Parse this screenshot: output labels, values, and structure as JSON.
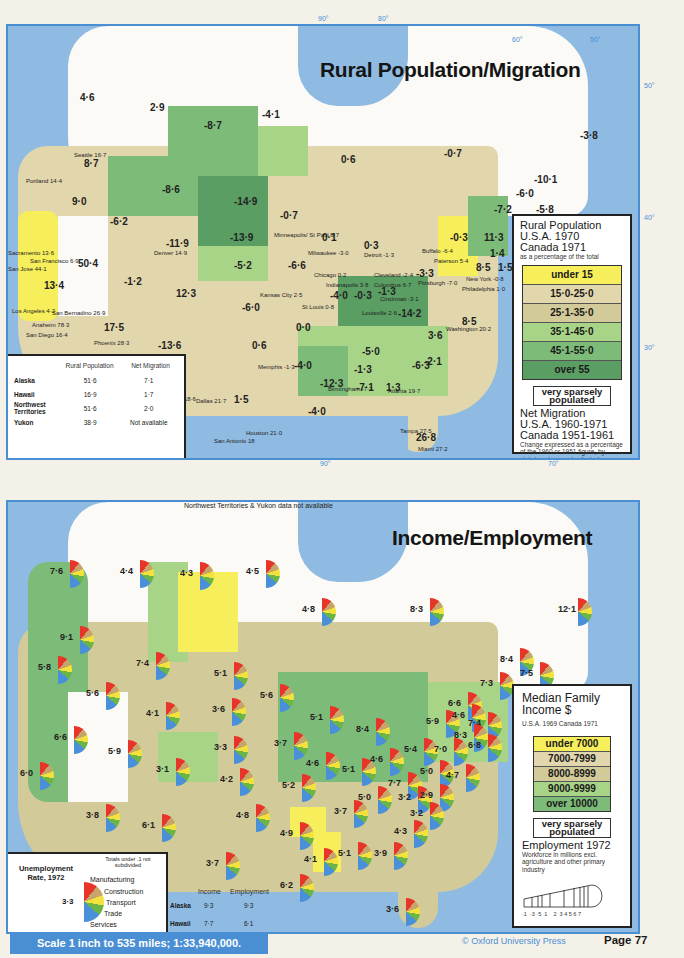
{
  "page": {
    "scale_text": "Scale 1 inch to 535 miles; 1:33,940,000.",
    "copyright": "© Oxford University Press",
    "page_label": "Page 77"
  },
  "colors": {
    "sea": "#8fbbe3",
    "border_blue": "#4a8fd4",
    "cls_under15": "#f6ee5a",
    "cls_15_25": "#e2d6ac",
    "cls_25_35": "#d2ca98",
    "cls_35_45": "#a8d488",
    "cls_45_55": "#7dbb78",
    "cls_over55": "#5a9e63",
    "pie_manufacturing": "#e8352a",
    "pie_construction": "#c7a46a",
    "pie_transport": "#f3e23c",
    "pie_trade": "#6ab545",
    "pie_services": "#4a90d9"
  },
  "map1": {
    "title": "Rural Population/Migration",
    "degrees": {
      "lon90": "90°",
      "lon80": "80°",
      "lon60": "60°",
      "lon50": "50°",
      "lat50": "50°",
      "lat40": "40°",
      "lat30": "30°",
      "bottom90": "90°",
      "bottom70": "70°"
    },
    "legend": {
      "title1": "Rural Population",
      "title2": "U.S.A. 1970",
      "title3": "Canada 1971",
      "subtitle": "as a percentage of the total",
      "classes": [
        "under 15",
        "15·0-25·0",
        "25·1-35·0",
        "35·1-45·0",
        "45·1-55·0",
        "over 55"
      ],
      "sparse": "very sparsely populated",
      "migration_title1": "Net Migration",
      "migration_title2": "U.S.A. 1960-1971",
      "migration_title3": "Canada 1951-1961",
      "migration_note": "Change expressed as a percentage of the 1960 or 1951 figure, by state/province and selected Standard Metropolitan Statistical Areas"
    },
    "table": {
      "headers": [
        "",
        "Rural Population",
        "Net Migration"
      ],
      "rows": [
        [
          "Alaska",
          "51·6",
          "7·1"
        ],
        [
          "Hawaii",
          "16·9",
          "1·7"
        ],
        [
          "Northwest Territories",
          "51·6",
          "2·0"
        ],
        [
          "Yukon",
          "38·9",
          "Not available"
        ]
      ]
    },
    "region_values": [
      {
        "v": "4·6",
        "x": 72,
        "y": 66
      },
      {
        "v": "2·9",
        "x": 142,
        "y": 76
      },
      {
        "v": "-8·7",
        "x": 196,
        "y": 94
      },
      {
        "v": "-4·1",
        "x": 254,
        "y": 83
      },
      {
        "v": "0·6",
        "x": 333,
        "y": 128
      },
      {
        "v": "-0·7",
        "x": 436,
        "y": 122
      },
      {
        "v": "-3·8",
        "x": 572,
        "y": 104
      },
      {
        "v": "8·7",
        "x": 76,
        "y": 132
      },
      {
        "v": "9·0",
        "x": 64,
        "y": 170
      },
      {
        "v": "-8·6",
        "x": 154,
        "y": 158
      },
      {
        "v": "-14·9",
        "x": 226,
        "y": 170
      },
      {
        "v": "-0·7",
        "x": 272,
        "y": 184
      },
      {
        "v": "-6·2",
        "x": 102,
        "y": 190
      },
      {
        "v": "-13·9",
        "x": 222,
        "y": 206
      },
      {
        "v": "-11·9",
        "x": 158,
        "y": 212
      },
      {
        "v": "0·1",
        "x": 314,
        "y": 206
      },
      {
        "v": "0·3",
        "x": 356,
        "y": 214
      },
      {
        "v": "-10·1",
        "x": 526,
        "y": 148
      },
      {
        "v": "-6·0",
        "x": 508,
        "y": 162
      },
      {
        "v": "-7·2",
        "x": 486,
        "y": 178
      },
      {
        "v": "-5·8",
        "x": 528,
        "y": 178
      },
      {
        "v": "-0·3",
        "x": 442,
        "y": 206
      },
      {
        "v": "11·3",
        "x": 476,
        "y": 206
      },
      {
        "v": "1·4",
        "x": 482,
        "y": 222
      },
      {
        "v": "8·5",
        "x": 468,
        "y": 236
      },
      {
        "v": "1·5",
        "x": 490,
        "y": 236
      },
      {
        "v": "50·4",
        "x": 70,
        "y": 232
      },
      {
        "v": "13·4",
        "x": 36,
        "y": 254
      },
      {
        "v": "-1·2",
        "x": 116,
        "y": 250
      },
      {
        "v": "12·3",
        "x": 168,
        "y": 262
      },
      {
        "v": "-5·2",
        "x": 226,
        "y": 234
      },
      {
        "v": "-6·6",
        "x": 280,
        "y": 234
      },
      {
        "v": "-3·3",
        "x": 408,
        "y": 242
      },
      {
        "v": "-6·0",
        "x": 234,
        "y": 276
      },
      {
        "v": "-4·0",
        "x": 322,
        "y": 264
      },
      {
        "v": "-0·3",
        "x": 346,
        "y": 264
      },
      {
        "v": "-1·3",
        "x": 370,
        "y": 260
      },
      {
        "v": "-14·2",
        "x": 390,
        "y": 282
      },
      {
        "v": "8·5",
        "x": 454,
        "y": 290
      },
      {
        "v": "17·5",
        "x": 96,
        "y": 296
      },
      {
        "v": "-13·6",
        "x": 150,
        "y": 314
      },
      {
        "v": "0·0",
        "x": 288,
        "y": 296
      },
      {
        "v": "-5·0",
        "x": 354,
        "y": 320
      },
      {
        "v": "3·6",
        "x": 420,
        "y": 304
      },
      {
        "v": "0·6",
        "x": 244,
        "y": 314
      },
      {
        "v": "-1·3",
        "x": 346,
        "y": 338
      },
      {
        "v": "-2·1",
        "x": 416,
        "y": 330
      },
      {
        "v": "-4·0",
        "x": 286,
        "y": 334
      },
      {
        "v": "-6·3",
        "x": 404,
        "y": 334
      },
      {
        "v": "-12·3",
        "x": 312,
        "y": 352
      },
      {
        "v": "-7·1",
        "x": 348,
        "y": 356
      },
      {
        "v": "1·3",
        "x": 378,
        "y": 356
      },
      {
        "v": "1·5",
        "x": 226,
        "y": 368
      },
      {
        "v": "-4·0",
        "x": 300,
        "y": 380
      },
      {
        "v": "26·8",
        "x": 408,
        "y": 406
      }
    ],
    "cities": [
      {
        "t": "Seattle 16·7",
        "x": 66,
        "y": 126
      },
      {
        "t": "Portland 14·4",
        "x": 18,
        "y": 152
      },
      {
        "t": "Sacramento 13·6",
        "x": 0,
        "y": 224
      },
      {
        "t": "San Francisco 6·9",
        "x": 22,
        "y": 232
      },
      {
        "t": "San Jose 44·1",
        "x": 0,
        "y": 240
      },
      {
        "t": "Los Angeles 4·2",
        "x": 4,
        "y": 282
      },
      {
        "t": "San Bernadino 26·9",
        "x": 44,
        "y": 284
      },
      {
        "t": "Anaheim 78·3",
        "x": 24,
        "y": 296
      },
      {
        "t": "San Diego 16·4",
        "x": 18,
        "y": 306
      },
      {
        "t": "Phoenix 28·3",
        "x": 86,
        "y": 314
      },
      {
        "t": "Denver 14·9",
        "x": 146,
        "y": 224
      },
      {
        "t": "Minneapolis/ St Paul 6·7",
        "x": 266,
        "y": 206
      },
      {
        "t": "Milwaukee -3·0",
        "x": 300,
        "y": 224
      },
      {
        "t": "Detroit -1·3",
        "x": 356,
        "y": 226
      },
      {
        "t": "Chicago 0·2",
        "x": 306,
        "y": 246
      },
      {
        "t": "Indianapolis 3·8",
        "x": 318,
        "y": 256
      },
      {
        "t": "Kansas City 2·5",
        "x": 252,
        "y": 266
      },
      {
        "t": "St Louis 0·8",
        "x": 294,
        "y": 278
      },
      {
        "t": "Cleveland -2·4",
        "x": 366,
        "y": 246
      },
      {
        "t": "Columbus 6·7",
        "x": 366,
        "y": 256
      },
      {
        "t": "Cincinnati -3·1",
        "x": 372,
        "y": 270
      },
      {
        "t": "Louisville 2·6",
        "x": 354,
        "y": 284
      },
      {
        "t": "Buffalo -6·4",
        "x": 414,
        "y": 222
      },
      {
        "t": "Paterson 5·4",
        "x": 426,
        "y": 232
      },
      {
        "t": "Pittsburgh -7·0",
        "x": 410,
        "y": 254
      },
      {
        "t": "New York -0·8",
        "x": 458,
        "y": 250
      },
      {
        "t": "Philadelphia 1·0",
        "x": 454,
        "y": 260
      },
      {
        "t": "Washington 20·2",
        "x": 438,
        "y": 300
      },
      {
        "t": "Memphis -1·3",
        "x": 250,
        "y": 338
      },
      {
        "t": "Birmingham -7·3",
        "x": 320,
        "y": 360
      },
      {
        "t": "Atlanta 19·7",
        "x": 380,
        "y": 362
      },
      {
        "t": "Fort Worth 18·6",
        "x": 146,
        "y": 370
      },
      {
        "t": "Dallas 21·7",
        "x": 188,
        "y": 372
      },
      {
        "t": "Houston 21·0",
        "x": 238,
        "y": 404
      },
      {
        "t": "San Antonio 18",
        "x": 206,
        "y": 412
      },
      {
        "t": "Tampa 27·5",
        "x": 392,
        "y": 402
      },
      {
        "t": "Miami 27·2",
        "x": 410,
        "y": 420
      }
    ]
  },
  "map2": {
    "title": "Income/Employment",
    "note": "Northwest Territories & Yukon data not available",
    "legend": {
      "title1": "Median Family",
      "title2": "Income $",
      "subtitle": "U.S.A. 1969   Canada 1971",
      "classes": [
        "under 7000",
        "7000-7999",
        "8000-8999",
        "9000-9999",
        "over 10000"
      ],
      "sparse": "very sparsely populated",
      "employment_title": "Employment 1972",
      "employment_note": "Workforce in millions excl. agriculture and other primary industry",
      "scale_ticks": "·1  ·3 ·5  1    2  3 4 5 6 7"
    },
    "unemployment_key": {
      "title": "Unemployment Rate, 1972",
      "note": "Totals under .1 not subdivided",
      "sample_value": "3·3",
      "sectors": [
        "Manufacturing",
        "Construction",
        "Transport",
        "Trade",
        "Services"
      ]
    },
    "inset": {
      "headers": [
        "",
        "Income",
        "Employment"
      ],
      "rows": [
        [
          "Alaska",
          "9·3",
          "9·3"
        ],
        [
          "Hawaii",
          "7·7",
          "6·1"
        ]
      ]
    },
    "pies": [
      {
        "v": "7·6",
        "x": 60,
        "y": 58
      },
      {
        "v": "4·4",
        "x": 130,
        "y": 58
      },
      {
        "v": "4·3",
        "x": 190,
        "y": 60
      },
      {
        "v": "4·5",
        "x": 256,
        "y": 58
      },
      {
        "v": "4·8",
        "x": 312,
        "y": 96
      },
      {
        "v": "8·3",
        "x": 420,
        "y": 96
      },
      {
        "v": "12·1",
        "x": 568,
        "y": 96
      },
      {
        "v": "9·1",
        "x": 70,
        "y": 124
      },
      {
        "v": "5·8",
        "x": 48,
        "y": 154
      },
      {
        "v": "7·4",
        "x": 146,
        "y": 150
      },
      {
        "v": "5·1",
        "x": 224,
        "y": 160
      },
      {
        "v": "8·4",
        "x": 510,
        "y": 146
      },
      {
        "v": "7·5",
        "x": 530,
        "y": 160
      },
      {
        "v": "7·3",
        "x": 490,
        "y": 170
      },
      {
        "v": "5·6",
        "x": 96,
        "y": 180
      },
      {
        "v": "5·6",
        "x": 270,
        "y": 182
      },
      {
        "v": "6·6",
        "x": 458,
        "y": 190
      },
      {
        "v": "4·1",
        "x": 156,
        "y": 200
      },
      {
        "v": "3·6",
        "x": 222,
        "y": 196
      },
      {
        "v": "5·1",
        "x": 320,
        "y": 204
      },
      {
        "v": "8·4",
        "x": 366,
        "y": 216
      },
      {
        "v": "5·9",
        "x": 436,
        "y": 208
      },
      {
        "v": "4·6",
        "x": 462,
        "y": 202
      },
      {
        "v": "7·4",
        "x": 478,
        "y": 210
      },
      {
        "v": "8·3",
        "x": 464,
        "y": 222
      },
      {
        "v": "6·8",
        "x": 478,
        "y": 232
      },
      {
        "v": "6·6",
        "x": 64,
        "y": 224
      },
      {
        "v": "3·3",
        "x": 224,
        "y": 234
      },
      {
        "v": "3·7",
        "x": 284,
        "y": 230
      },
      {
        "v": "5·4",
        "x": 414,
        "y": 236
      },
      {
        "v": "7·0",
        "x": 444,
        "y": 236
      },
      {
        "v": "5·9",
        "x": 118,
        "y": 238
      },
      {
        "v": "4·6",
        "x": 316,
        "y": 250
      },
      {
        "v": "5·1",
        "x": 352,
        "y": 256
      },
      {
        "v": "4·6",
        "x": 380,
        "y": 246
      },
      {
        "v": "5·0",
        "x": 430,
        "y": 258
      },
      {
        "v": "4·7",
        "x": 456,
        "y": 262
      },
      {
        "v": "6·0",
        "x": 30,
        "y": 260
      },
      {
        "v": "3·1",
        "x": 166,
        "y": 256
      },
      {
        "v": "4·2",
        "x": 230,
        "y": 266
      },
      {
        "v": "5·2",
        "x": 292,
        "y": 272
      },
      {
        "v": "7·7",
        "x": 398,
        "y": 270
      },
      {
        "v": "5·0",
        "x": 368,
        "y": 284
      },
      {
        "v": "3·2",
        "x": 408,
        "y": 284
      },
      {
        "v": "2·9",
        "x": 430,
        "y": 282
      },
      {
        "v": "3·8",
        "x": 96,
        "y": 302
      },
      {
        "v": "3·7",
        "x": 344,
        "y": 298
      },
      {
        "v": "3·2",
        "x": 420,
        "y": 300
      },
      {
        "v": "6·1",
        "x": 152,
        "y": 312
      },
      {
        "v": "4·8",
        "x": 246,
        "y": 302
      },
      {
        "v": "4·9",
        "x": 290,
        "y": 320
      },
      {
        "v": "4·3",
        "x": 404,
        "y": 318
      },
      {
        "v": "4·1",
        "x": 314,
        "y": 346
      },
      {
        "v": "5·1",
        "x": 348,
        "y": 340
      },
      {
        "v": "3·9",
        "x": 384,
        "y": 340
      },
      {
        "v": "3·7",
        "x": 216,
        "y": 350
      },
      {
        "v": "6·2",
        "x": 290,
        "y": 372
      },
      {
        "v": "3·6",
        "x": 396,
        "y": 396
      }
    ]
  }
}
